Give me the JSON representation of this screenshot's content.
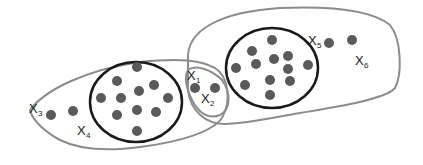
{
  "diagram": {
    "title": "",
    "colors": {
      "background": "#ffffff",
      "hull": "#8c8c8c",
      "core": "#1a1a1a",
      "point": "#5a5a5a",
      "label": "#1a1a1a"
    },
    "clusters": [
      {
        "id": "left",
        "core_points": 12
      },
      {
        "id": "right",
        "core_points": 12
      }
    ],
    "labels": {
      "x1": {
        "main": "X",
        "sub": "1"
      },
      "x2": {
        "main": "X",
        "sub": "2"
      },
      "x3": {
        "main": "X",
        "sub": "3"
      },
      "x4": {
        "main": "X",
        "sub": "4"
      },
      "x5": {
        "main": "X",
        "sub": "5"
      },
      "x6": {
        "main": "X",
        "sub": "6"
      }
    }
  }
}
